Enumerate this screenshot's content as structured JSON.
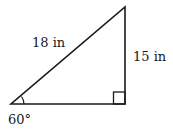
{
  "diagram": {
    "type": "right-triangle",
    "vertices": {
      "A": {
        "x": 11,
        "y": 104,
        "angle_label": "60°"
      },
      "B": {
        "x": 125,
        "y": 104,
        "right_angle": true
      },
      "C": {
        "x": 125,
        "y": 7
      }
    },
    "labels": {
      "hypotenuse": "18 in",
      "vertical_leg": "15 in",
      "angle": "60°"
    },
    "colors": {
      "stroke": "#1a1a1a",
      "text": "#1a1a1a",
      "background": "#ffffff"
    }
  }
}
